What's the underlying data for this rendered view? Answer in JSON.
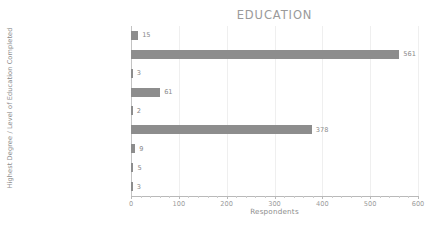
{
  "chart_data": {
    "type": "bar",
    "orientation": "horizontal",
    "title": "EDUCATION",
    "xlabel": "Respondents",
    "ylabel": "Highest Degree / Level of Education Completed",
    "categories": [
      "Associate's Degree",
      "Bachelor's Degree",
      "Bachelor's Degree + Certificate",
      "High School Degree or Equivalent",
      "Less than High School",
      "Master's Degree",
      "PhD or Higher",
      "Trade School",
      "Prefer not to answer"
    ],
    "values": [
      15,
      561,
      3,
      61,
      2,
      378,
      9,
      5,
      3
    ],
    "value_labels": [
      "15",
      "561",
      "3",
      "61",
      "2",
      "378",
      "9",
      "5",
      "3"
    ],
    "xlim": [
      0,
      600
    ],
    "xticks": [
      0,
      100,
      200,
      300,
      400,
      500,
      600
    ],
    "xtick_labels": [
      "0",
      "100",
      "200",
      "300",
      "400",
      "500",
      "600"
    ],
    "grid": true,
    "grid_axis": "x",
    "legend": false,
    "bar_color": "#8d8d8d",
    "background_color": "#ffffff",
    "text_color": "#8c8c8c",
    "gridline_color": "#efefef",
    "axis_color": "#b9b9b9"
  }
}
